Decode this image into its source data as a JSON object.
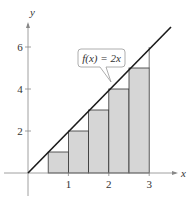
{
  "diagram": {
    "function_label": "f(x) = 2x",
    "axes": {
      "x_label": "x",
      "y_label": "y",
      "x_ticks": [
        "1",
        "2",
        "3"
      ],
      "y_ticks": [
        "2",
        "4",
        "6"
      ]
    },
    "rectangles": [
      {
        "x0": 0.5,
        "x1": 1.0,
        "height": 1
      },
      {
        "x0": 1.0,
        "x1": 1.5,
        "height": 2
      },
      {
        "x0": 1.5,
        "x1": 2.0,
        "height": 3
      },
      {
        "x0": 2.0,
        "x1": 2.5,
        "height": 4
      },
      {
        "x0": 2.5,
        "x1": 3.0,
        "height": 5
      }
    ],
    "colors": {
      "fill": "#d6d6d6",
      "line": "#1a1a1a",
      "axis": "#888888"
    }
  }
}
